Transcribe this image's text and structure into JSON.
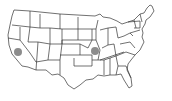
{
  "map": {
    "type": "us-states-outline",
    "region": "United States (contiguous)",
    "stroke_color": "#333333",
    "fill_color": "#ffffff",
    "markers": [
      {
        "name": "marker-california",
        "state": "California",
        "x": 18,
        "y": 52,
        "r": 4,
        "color": "#808080"
      },
      {
        "name": "marker-missouri",
        "state": "Missouri",
        "x": 95,
        "y": 51,
        "r": 4,
        "color": "#808080"
      }
    ]
  }
}
